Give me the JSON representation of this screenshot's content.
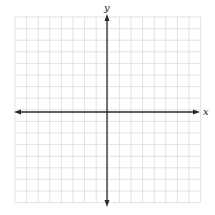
{
  "plane": {
    "x_axis_label": "x",
    "y_axis_label": "y",
    "grid": {
      "columns": 16,
      "rows": 16,
      "left": 15,
      "top": 17,
      "cell": 11.6,
      "line_color": "#dcdcdc"
    },
    "origin": {
      "x": 107,
      "y": 112
    },
    "axis_color": "#2a2a2a",
    "background": "#ffffff"
  }
}
